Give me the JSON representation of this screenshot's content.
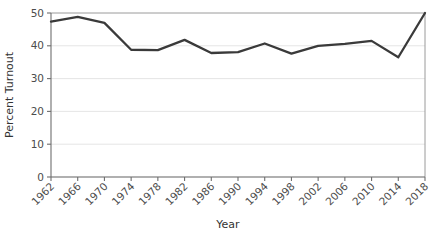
{
  "chart_data": {
    "type": "line",
    "title": "",
    "xlabel": "Year",
    "ylabel": "Percent Turnout",
    "xlim": [
      1962,
      2018
    ],
    "ylim": [
      0,
      50
    ],
    "grid": true,
    "legend": "none",
    "x_tick_labels": [
      "1962",
      "1966",
      "1970",
      "1974",
      "1978",
      "1982",
      "1986",
      "1990",
      "1994",
      "1998",
      "2002",
      "2006",
      "2010",
      "2014",
      "2018"
    ],
    "y_tick_labels": [
      "0",
      "10",
      "20",
      "30",
      "40",
      "50"
    ],
    "y_ticks": [
      0,
      10,
      20,
      30,
      40,
      50
    ],
    "x": [
      1962,
      1966,
      1970,
      1974,
      1978,
      1982,
      1986,
      1990,
      1994,
      1998,
      2002,
      2006,
      2010,
      2014,
      2018
    ],
    "values": [
      47.4,
      48.8,
      47.0,
      38.8,
      38.7,
      41.8,
      37.8,
      38.1,
      40.7,
      37.6,
      40.0,
      40.6,
      41.5,
      36.5,
      50.0
    ],
    "series": [
      {
        "name": "Percent Turnout",
        "color": "#3a3a3a",
        "values": [
          47.4,
          48.8,
          47.0,
          38.8,
          38.7,
          41.8,
          37.8,
          38.1,
          40.7,
          37.6,
          40.0,
          40.6,
          41.5,
          36.5,
          50.0
        ]
      }
    ]
  },
  "axes": {
    "y_title": "Percent Turnout",
    "x_title": "Year"
  },
  "colors": {
    "line": "#3a3a3a",
    "grid": "#e2e2e2",
    "axis": "#6e6e6e",
    "background": "#ffffff"
  }
}
